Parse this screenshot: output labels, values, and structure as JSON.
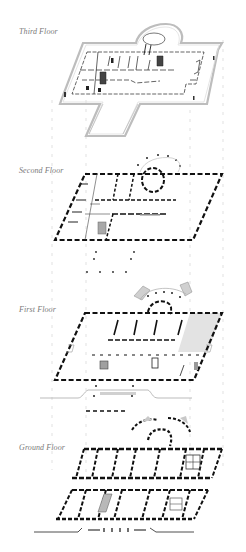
{
  "diagram": {
    "colors": {
      "background": "#ffffff",
      "wall_dark": "#111111",
      "wall_light": "#555555",
      "outline_gray": "#b8b8b8",
      "fill_gray": "#d9d9d9",
      "fill_stair": "#9a9a9a",
      "guide": "#c8c8c8",
      "label": "#7a7a7a"
    },
    "floors": [
      {
        "id": "third",
        "label": "Third Floor",
        "label_x": 19,
        "label_y": 27
      },
      {
        "id": "second",
        "label": "Second Floor",
        "label_x": 19,
        "label_y": 166
      },
      {
        "id": "first",
        "label": "First Floor",
        "label_x": 19,
        "label_y": 305
      },
      {
        "id": "ground",
        "label": "Ground Floor",
        "label_x": 19,
        "label_y": 443
      }
    ]
  }
}
